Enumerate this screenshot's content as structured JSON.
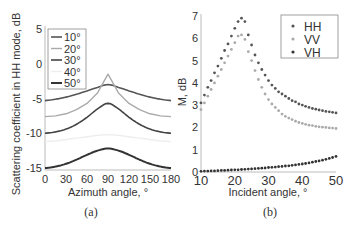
{
  "chart_data": [
    {
      "panel": "(a)",
      "type": "line",
      "title": "",
      "xlabel": "Azimuth angle, °",
      "ylabel": "Scattering coefficient in HH mode, dB",
      "xlim": [
        0,
        180
      ],
      "ylim": [
        -15,
        5
      ],
      "xticks": [
        0,
        30,
        60,
        90,
        120,
        150,
        180
      ],
      "yticks": [
        5,
        0,
        -5,
        -10,
        -15
      ],
      "grid": false,
      "legend_position": "upper left",
      "x": [
        0,
        15,
        30,
        45,
        60,
        75,
        90,
        105,
        120,
        135,
        150,
        165,
        180
      ],
      "series": [
        {
          "name": "10°",
          "color": "#555555",
          "width": 1.6,
          "values": [
            -5.3,
            -5.1,
            -4.8,
            -4.4,
            -3.9,
            -3.4,
            -3.0,
            -3.4,
            -3.9,
            -4.4,
            -4.8,
            -5.1,
            -5.3
          ]
        },
        {
          "name": "20°",
          "color": "#aaaaaa",
          "width": 1.4,
          "values": [
            -7.6,
            -7.5,
            -7.2,
            -6.6,
            -5.7,
            -4.2,
            -1.5,
            -4.2,
            -5.7,
            -6.6,
            -7.2,
            -7.5,
            -7.6
          ]
        },
        {
          "name": "30°",
          "color": "#444444",
          "width": 1.6,
          "values": [
            -10.0,
            -9.8,
            -9.4,
            -8.7,
            -7.7,
            -6.5,
            -5.7,
            -6.5,
            -7.7,
            -8.7,
            -9.4,
            -9.8,
            -10.0
          ]
        },
        {
          "name": "40°",
          "color": "#eeeeee",
          "width": 1.4,
          "values": [
            -11.2,
            -11.1,
            -10.9,
            -10.7,
            -10.5,
            -10.3,
            -10.2,
            -10.3,
            -10.5,
            -10.7,
            -10.9,
            -11.1,
            -11.2
          ]
        },
        {
          "name": "50°",
          "color": "#333333",
          "width": 2.0,
          "values": [
            -15.0,
            -14.8,
            -14.4,
            -13.8,
            -13.1,
            -12.5,
            -12.2,
            -12.5,
            -13.1,
            -13.8,
            -14.4,
            -14.8,
            -15.0
          ]
        }
      ]
    },
    {
      "panel": "(b)",
      "type": "scatter",
      "title": "",
      "xlabel": "Incident angle, °",
      "ylabel": "M, dB",
      "xlim": [
        10,
        50
      ],
      "ylim": [
        0,
        7
      ],
      "xticks": [
        10,
        20,
        30,
        40,
        50
      ],
      "yticks": [
        0,
        1,
        2,
        3,
        4,
        5,
        6,
        7
      ],
      "grid": false,
      "legend_position": "upper right",
      "x": [
        10,
        11,
        12,
        13,
        14,
        15,
        16,
        17,
        18,
        19,
        20,
        21,
        22,
        23,
        24,
        25,
        26,
        27,
        28,
        29,
        30,
        31,
        32,
        33,
        34,
        35,
        36,
        37,
        38,
        39,
        40,
        41,
        42,
        43,
        44,
        45,
        46,
        47,
        48,
        49,
        50
      ],
      "series": [
        {
          "name": "HH",
          "color": "#555555",
          "values": [
            3.1,
            3.45,
            3.8,
            4.1,
            4.45,
            4.75,
            5.1,
            5.45,
            5.75,
            6.1,
            6.45,
            6.75,
            6.9,
            6.75,
            6.15,
            5.7,
            5.25,
            4.9,
            4.6,
            4.35,
            4.1,
            3.9,
            3.75,
            3.6,
            3.5,
            3.4,
            3.3,
            3.2,
            3.15,
            3.05,
            3.0,
            2.95,
            2.9,
            2.85,
            2.82,
            2.78,
            2.75,
            2.72,
            2.7,
            2.68,
            2.65
          ]
        },
        {
          "name": "VV",
          "color": "#aaaaaa",
          "values": [
            2.8,
            3.1,
            3.4,
            3.7,
            4.0,
            4.3,
            4.6,
            4.9,
            5.2,
            5.5,
            5.8,
            6.1,
            6.15,
            5.95,
            5.4,
            5.0,
            4.55,
            4.15,
            3.8,
            3.5,
            3.25,
            3.05,
            2.9,
            2.75,
            2.6,
            2.5,
            2.42,
            2.35,
            2.28,
            2.22,
            2.18,
            2.14,
            2.1,
            2.08,
            2.05,
            2.03,
            2.01,
            2.0,
            1.98,
            1.97,
            1.95
          ]
        },
        {
          "name": "VH",
          "color": "#333333",
          "values": [
            0.03,
            0.04,
            0.04,
            0.05,
            0.05,
            0.06,
            0.07,
            0.07,
            0.08,
            0.09,
            0.1,
            0.1,
            0.11,
            0.12,
            0.13,
            0.14,
            0.15,
            0.16,
            0.17,
            0.18,
            0.2,
            0.21,
            0.22,
            0.24,
            0.25,
            0.27,
            0.28,
            0.3,
            0.32,
            0.34,
            0.36,
            0.38,
            0.41,
            0.44,
            0.47,
            0.5,
            0.53,
            0.57,
            0.61,
            0.65,
            0.7
          ]
        }
      ]
    }
  ],
  "figure": {
    "caption_a": "(a)",
    "caption_b": "(b)"
  }
}
